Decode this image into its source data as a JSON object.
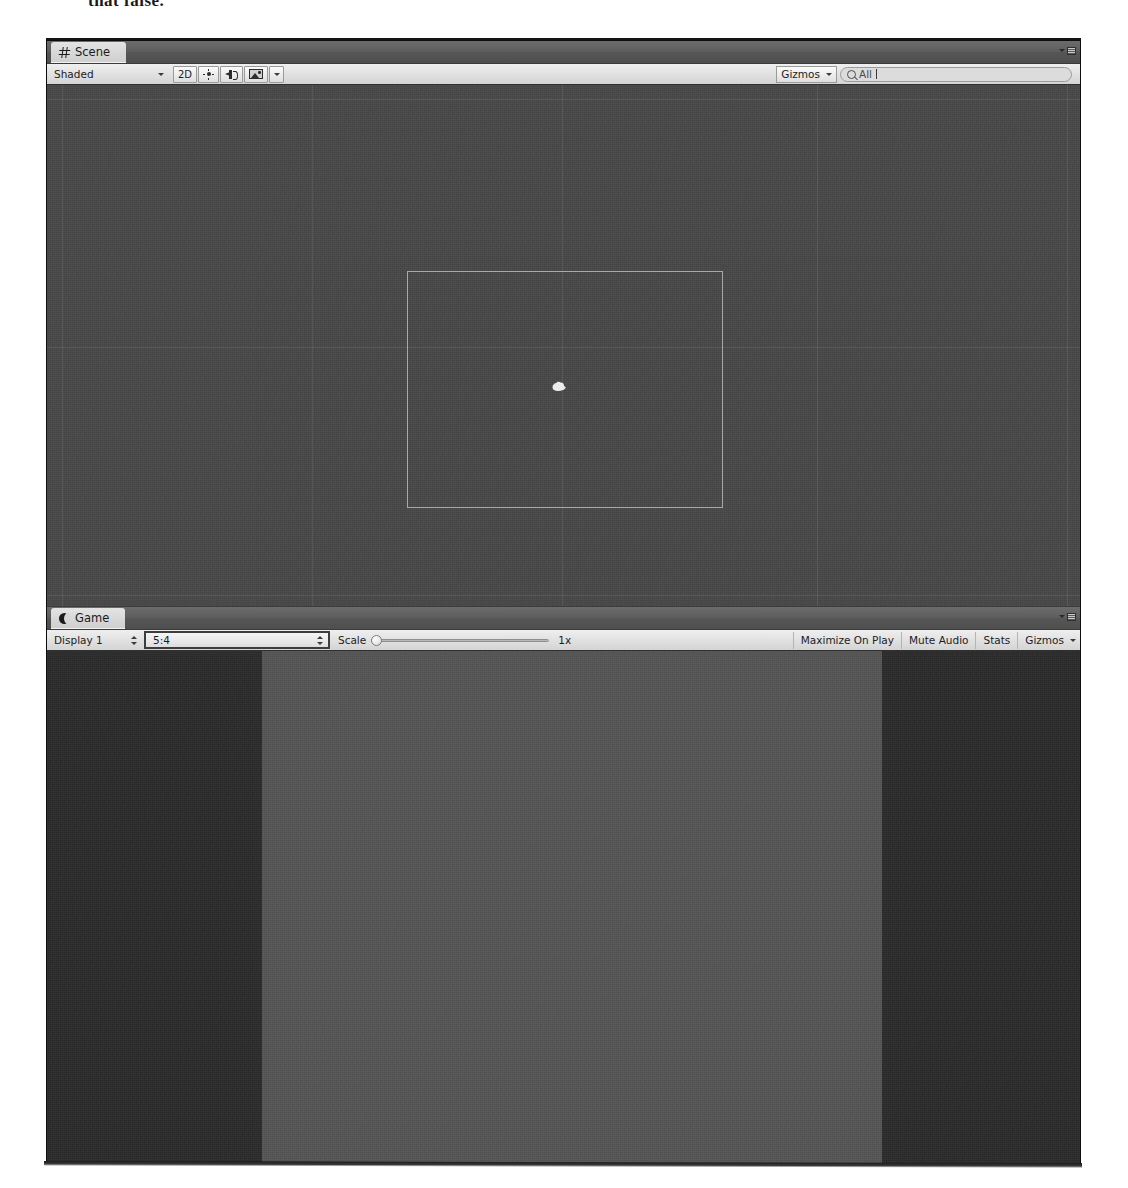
{
  "scan": {
    "headline_fragment": "that false.",
    "bleed_fragments": [
      "",
      "",
      ""
    ]
  },
  "colors": {
    "scene_background": "#484848",
    "game_letterbox": "#2b2b2b",
    "game_render": "#555555",
    "toolbar": "#e4e4e4",
    "tabbar": "#5d5d5d",
    "camera_gizmo_outline": "#e8e8e8",
    "focus_border": "#3d3d3d"
  },
  "scene_panel": {
    "tab": {
      "label": "Scene",
      "icon": "hash-icon"
    },
    "options_menu": "panel-options-icon",
    "toolbar": {
      "draw_mode": {
        "label": "Shaded",
        "icon": "chevron-down-icon"
      },
      "two_d_toggle": {
        "label": "2D",
        "active": true
      },
      "lighting_toggle": {
        "icon": "sun-icon"
      },
      "audio_toggle": {
        "icon": "speaker-icon"
      },
      "fx_toggle": {
        "icon": "image-icon"
      },
      "fx_dropdown": {
        "icon": "chevron-down-icon"
      },
      "gizmos": {
        "label": "Gizmos",
        "icon": "chevron-down-icon"
      },
      "search": {
        "value": "All",
        "placeholder": "All",
        "icon": "search-icon"
      }
    },
    "viewport": {
      "grid_vertical_x": [
        15,
        265,
        515,
        770,
        1020
      ],
      "grid_horizontal_y": [
        14,
        262,
        510
      ],
      "camera_rect": {
        "x": 360,
        "y": 186,
        "w": 316,
        "h": 237
      },
      "sprite": {
        "x": 503,
        "y": 295,
        "label": "scene-sprite"
      }
    }
  },
  "game_panel": {
    "tab": {
      "label": "Game",
      "icon": "moon-icon"
    },
    "options_menu": "panel-options-icon",
    "toolbar": {
      "display": {
        "label": "Display 1",
        "icon": "stepper-icon"
      },
      "aspect": {
        "label": "5:4",
        "icon": "stepper-icon",
        "focused": true
      },
      "scale": {
        "label": "Scale",
        "value": "1x",
        "slider_position_pct": 0
      },
      "maximize_on_play": {
        "label": "Maximize On Play"
      },
      "mute_audio": {
        "label": "Mute Audio"
      },
      "stats": {
        "label": "Stats"
      },
      "gizmos": {
        "label": "Gizmos",
        "icon": "chevron-down-icon"
      }
    },
    "viewport": {
      "render_area": {
        "x": 215,
        "w": 620
      },
      "letterbox": true
    }
  }
}
